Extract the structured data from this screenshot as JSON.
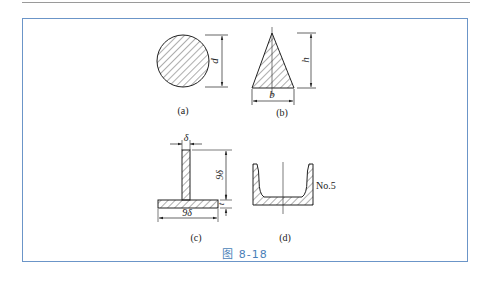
{
  "figure": {
    "caption": "图 8-18",
    "accent_color": "#4a7fb8",
    "frame_color": "#6b95c8",
    "panels": [
      {
        "id": "a",
        "label": "(a)",
        "shape": "circle",
        "dimensions": [
          "d"
        ]
      },
      {
        "id": "b",
        "label": "(b)",
        "shape": "triangle",
        "dimensions": [
          "h",
          "b"
        ]
      },
      {
        "id": "c",
        "label": "(c)",
        "shape": "T-section",
        "dimensions": [
          "δ",
          "9δ",
          "t",
          "9δ"
        ]
      },
      {
        "id": "d",
        "label": "(d)",
        "shape": "channel-section",
        "annotation": "No.5"
      }
    ]
  },
  "labels": {
    "a": "(a)",
    "b": "(b)",
    "c": "(c)",
    "d": "(d)",
    "dim_d": "d",
    "dim_h": "h",
    "dim_b": "b",
    "dim_delta": "δ",
    "dim_9delta_v": "9δ",
    "dim_t": "t",
    "dim_9delta_h": "9δ",
    "no5": "No.5"
  }
}
